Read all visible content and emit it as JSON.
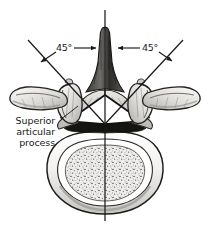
{
  "figure": {
    "kind": "anatomical-illustration",
    "background_color": "#ffffff",
    "ink_color": "#1a1a1a",
    "width": 211,
    "height": 226
  },
  "annotations": {
    "angle_left": "45°",
    "angle_right": "45°",
    "callout_line1": "Superior",
    "callout_line2": "articular",
    "callout_line3": "process"
  },
  "geometry": {
    "midline": {
      "x": 105,
      "y_top": 10,
      "y_bottom": 221
    },
    "facet_apex": {
      "x": 105,
      "y": 124
    },
    "left_ray_end": {
      "x": 28,
      "y": 40
    },
    "right_ray_end": {
      "x": 183,
      "y": 40
    },
    "angle_value_deg": 45
  },
  "structures": [
    {
      "name": "spinous-process",
      "label": "spinous process"
    },
    {
      "name": "vertebral-body",
      "label": "vertebral body"
    },
    {
      "name": "vertebral-foramen",
      "label": "vertebral foramen"
    },
    {
      "name": "superior-articular-process-left",
      "label": "superior articular process"
    },
    {
      "name": "superior-articular-process-right",
      "label": "superior articular process"
    },
    {
      "name": "transverse-process-left",
      "label": "transverse process"
    },
    {
      "name": "transverse-process-right",
      "label": "transverse process"
    },
    {
      "name": "lamina-left",
      "label": "lamina"
    },
    {
      "name": "lamina-right",
      "label": "lamina"
    },
    {
      "name": "pedicle-left",
      "label": "pedicle"
    },
    {
      "name": "pedicle-right",
      "label": "pedicle"
    }
  ]
}
